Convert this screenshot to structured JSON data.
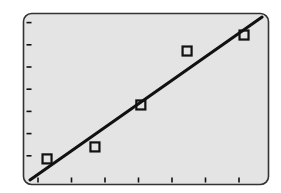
{
  "chart_data": {
    "type": "scatter",
    "title": "",
    "xlabel": "",
    "ylabel": "",
    "grid": false,
    "legend": null,
    "x_ticks": [
      1,
      2,
      3,
      4,
      5,
      6,
      7
    ],
    "y_ticks": [
      1,
      2,
      3,
      4,
      5,
      6,
      7
    ],
    "tick_labels_shown": false,
    "xlim": [
      0.55,
      7.87
    ],
    "ylim": [
      -0.28,
      7.42
    ],
    "series": [
      {
        "name": "data points",
        "marker": "open-square",
        "x": [
          1.27,
          2.7,
          4.07,
          5.45,
          7.15
        ],
        "y": [
          0.86,
          1.4,
          3.29,
          5.72,
          6.44
        ]
      },
      {
        "name": "linear fit",
        "type": "line",
        "x": [
          0.76,
          7.69
        ],
        "y": [
          -0.09,
          7.25
        ]
      }
    ]
  },
  "style": {
    "plot_background": "#e4e4e4",
    "frame_color": "#333333",
    "ink_color": "#111111"
  }
}
